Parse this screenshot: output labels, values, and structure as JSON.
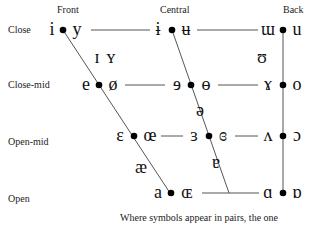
{
  "title_columns": {
    "front": "Front",
    "central": "Central",
    "back": "Back"
  },
  "rows": {
    "close": "Close",
    "close_mid": "Close-mid",
    "open_mid": "Open-mid",
    "open": "Open"
  },
  "symbols": {
    "close": {
      "front_unrounded": "i",
      "front_rounded": "y",
      "central_unrounded": "ɨ",
      "central_rounded": "ʉ",
      "back_unrounded": "ɯ",
      "back_rounded": "u"
    },
    "near_close": {
      "front_unrounded": "ɪ",
      "front_rounded": "ʏ",
      "back_rounded": "ʊ"
    },
    "close_mid": {
      "front_unrounded": "e",
      "front_rounded": "ø",
      "central_unrounded": "ɘ",
      "central_rounded": "ɵ",
      "back_unrounded": "ɤ",
      "back_rounded": "o"
    },
    "mid": {
      "central": "ə"
    },
    "open_mid": {
      "front_unrounded": "ɛ",
      "front_rounded": "œ",
      "central_unrounded": "ɜ",
      "central_rounded": "ɞ",
      "back_unrounded": "ʌ",
      "back_rounded": "ɔ"
    },
    "near_open": {
      "front": "æ",
      "central": "ɐ"
    },
    "open": {
      "front_unrounded": "a",
      "front_rounded": "ɶ",
      "back_unrounded": "ɑ",
      "back_rounded": "ɒ"
    }
  },
  "footnote": "Where symbols appear in pairs, the one",
  "colors": {
    "line": "#555555",
    "dot": "#000000",
    "text": "#111111"
  }
}
